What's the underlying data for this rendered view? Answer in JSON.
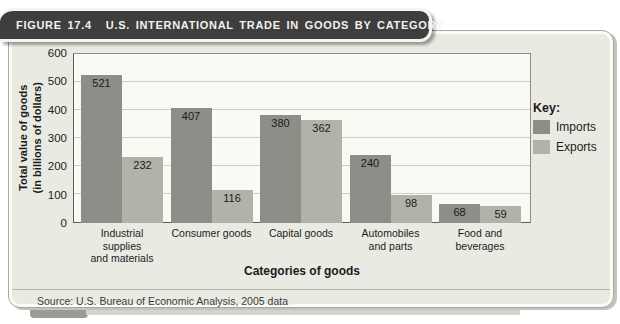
{
  "figure": {
    "label": "FIGURE 17.4",
    "title": "U.S. INTERNATIONAL TRADE IN GOODS BY CATEGORY"
  },
  "key": {
    "title": "Key:",
    "entries": [
      {
        "label": "Imports",
        "color": "#8d8e88"
      },
      {
        "label": "Exports",
        "color": "#b1b3a9"
      }
    ]
  },
  "source": "Source: U.S. Bureau of Economic Analysis, 2005 data",
  "chart_data": {
    "type": "bar",
    "title": "U.S. International Trade in Goods by Category",
    "categories": [
      "Industrial supplies and materials",
      "Consumer goods",
      "Capital goods",
      "Automobiles and parts",
      "Food and beverages"
    ],
    "category_lines": [
      [
        "Industrial supplies",
        "and materials"
      ],
      [
        "Consumer goods"
      ],
      [
        "Capital goods"
      ],
      [
        "Automobiles",
        "and parts"
      ],
      [
        "Food and",
        "beverages"
      ]
    ],
    "series": [
      {
        "name": "Imports",
        "color": "#8d8e88",
        "values": [
          521,
          407,
          380,
          240,
          68
        ]
      },
      {
        "name": "Exports",
        "color": "#b1b3a9",
        "values": [
          232,
          116,
          362,
          98,
          59
        ]
      }
    ],
    "xlabel": "Categories of goods",
    "ylabel": "Total value of goods\n(in billions of dollars)",
    "ylim": [
      0,
      600
    ],
    "yticks": [
      0,
      100,
      200,
      300,
      400,
      500,
      600
    ],
    "grid": true,
    "legend_position": "right",
    "plot_bg": "#faf9f3",
    "panel_bg": "#e9ebe3",
    "header_bg": "#3e3e3e"
  }
}
